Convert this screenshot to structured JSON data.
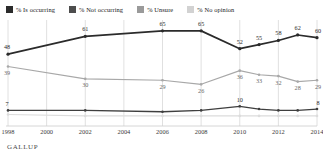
{
  "legend": {
    "items": [
      {
        "label": "% Is occurring",
        "color": "#2b2b2b",
        "key": "is_occurring"
      },
      {
        "label": "% Not occurring",
        "color": "#4d4d4d",
        "key": "not_occurring"
      },
      {
        "label": "% Unsure",
        "color": "#9a9a9a",
        "key": "unsure"
      },
      {
        "label": "% No opinion",
        "color": "#d2d2d2",
        "key": "no_opinion"
      }
    ]
  },
  "source": {
    "text": "GALLUP"
  },
  "chart_data": {
    "type": "line",
    "title": "",
    "xlabel": "",
    "ylabel": "",
    "grid": true,
    "legend_position": "top",
    "x": [
      1998,
      2000,
      2002,
      2004,
      2006,
      2008,
      2010,
      2011,
      2012,
      2013,
      2014
    ],
    "categories": [
      "1998",
      "2000",
      "2002",
      "2004",
      "2006",
      "2008",
      "2010",
      "2012",
      "2014"
    ],
    "xticks": [
      "1998",
      "2000",
      "2002",
      "2004",
      "2006",
      "2008",
      "2010",
      "2012",
      "2014"
    ],
    "ylim": [
      0,
      70
    ],
    "series": [
      {
        "name": "% Is occurring",
        "color": "#2b2b2b",
        "x": [
          1998,
          2002,
          2006,
          2008,
          2010,
          2011,
          2012,
          2013,
          2014
        ],
        "values": [
          48,
          61,
          65,
          65,
          52,
          55,
          58,
          62,
          60
        ],
        "labels": [
          "48",
          "61",
          "65",
          "65",
          "52",
          "55",
          "58",
          "62",
          "60"
        ]
      },
      {
        "name": "% Not occurring",
        "color": "#a8a8a8",
        "x": [
          1998,
          2002,
          2006,
          2008,
          2010,
          2011,
          2012,
          2013,
          2014
        ],
        "values": [
          39,
          30,
          29,
          26,
          36,
          33,
          32,
          28,
          29
        ],
        "labels": [
          "39",
          "30",
          "29",
          "26",
          "36",
          "33",
          "32",
          "28",
          "29"
        ]
      },
      {
        "name": "% Unsure",
        "color": "#3f3f3f",
        "x": [
          1998,
          2002,
          2006,
          2008,
          2010,
          2011,
          2012,
          2013,
          2014
        ],
        "values": [
          7,
          7,
          6,
          7,
          10,
          8,
          7,
          7,
          8
        ],
        "labels": [
          "7",
          "",
          "",
          "",
          "10",
          "",
          "",
          "",
          "8"
        ]
      },
      {
        "name": "% No opinion",
        "color": "#dcdcdc",
        "x": [
          1998,
          2002,
          2006,
          2008,
          2010,
          2011,
          2012,
          2013,
          2014
        ],
        "values": [
          4,
          3,
          3,
          3,
          3,
          3,
          3,
          3,
          3
        ],
        "labels": [
          "",
          "",
          "",
          "",
          "",
          "",
          "",
          "",
          ""
        ]
      }
    ]
  }
}
